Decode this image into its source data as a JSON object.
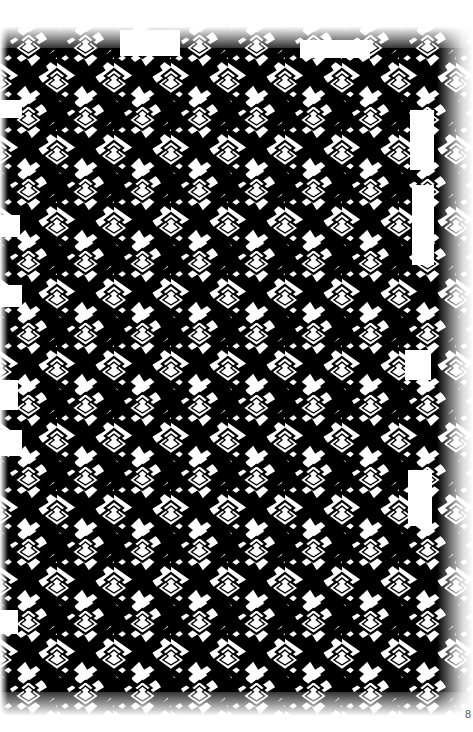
{
  "page": {
    "page_number": "8",
    "colors": {
      "ink": "#000000",
      "paper": "#ffffff"
    }
  },
  "pattern": {
    "motif": "interlocking-cross-lattice",
    "tile_width": 57,
    "tile_height": 72
  }
}
